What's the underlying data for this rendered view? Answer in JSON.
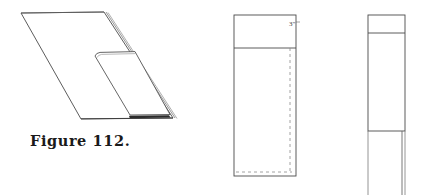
{
  "plate": {
    "caption": "Figure 112.",
    "background_color": "#ffffff",
    "ink_color": "#4a4a4a",
    "caption_color": "#1a1a1a",
    "shadow_color": "#2b2b2b",
    "width": 425,
    "height": 195
  },
  "panels": {
    "perspective": {
      "name": "perspective view of sheet with folded flap",
      "outer_outline_label": "sheet outline",
      "flap_label": "folded flap",
      "shadow_label": "shaded edge strip",
      "thickness_line_label": "edge thickness lines"
    },
    "front": {
      "name": "front elevation",
      "top_band_label": "top band",
      "fold_line_label": "dashed fold line",
      "dimension": "3\"",
      "dimension_position": "top right"
    },
    "side": {
      "name": "side elevation",
      "top_band_label": "top band",
      "stem_label": "lower stem"
    }
  }
}
